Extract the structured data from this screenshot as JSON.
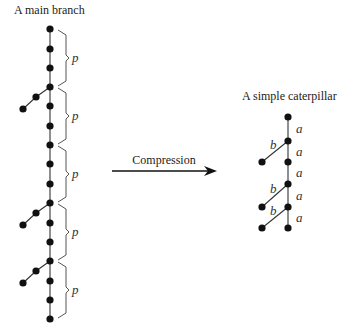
{
  "left": {
    "title": "A main branch",
    "spine_x": 50,
    "spine_nodes_y": [
      29,
      49,
      68,
      87,
      106,
      126,
      145,
      164,
      184,
      203,
      223,
      242,
      261,
      281,
      300,
      319
    ],
    "side_branches": [
      {
        "from_y": 87,
        "mid": [
          36,
          97
        ],
        "tip": [
          23,
          109
        ]
      },
      {
        "from_y": 203,
        "mid": [
          36,
          213
        ],
        "tip": [
          23,
          225
        ]
      },
      {
        "from_y": 261,
        "mid": [
          36,
          271
        ],
        "tip": [
          23,
          283
        ]
      }
    ],
    "brackets": [
      {
        "y1": 29,
        "y2": 87,
        "label": "p"
      },
      {
        "y1": 87,
        "y2": 145,
        "label": "p"
      },
      {
        "y1": 145,
        "y2": 203,
        "label": "p"
      },
      {
        "y1": 203,
        "y2": 261,
        "label": "p"
      },
      {
        "y1": 261,
        "y2": 319,
        "label": "p"
      }
    ]
  },
  "arrow": {
    "label": "Compression",
    "x1": 112,
    "x2": 217,
    "y": 171
  },
  "right": {
    "title": "A simple caterpillar",
    "spine_x": 288,
    "spine_nodes_y": [
      117,
      141,
      162,
      184,
      207,
      228
    ],
    "spine_edge_labels": [
      "a",
      "a",
      "a",
      "a",
      "a"
    ],
    "leaves": [
      {
        "from_y": 141,
        "tip": [
          262,
          162
        ],
        "label": "b"
      },
      {
        "from_y": 184,
        "tip": [
          262,
          207
        ],
        "label": "b"
      },
      {
        "from_y": 207,
        "tip": [
          262,
          228
        ],
        "label": "b"
      }
    ]
  }
}
